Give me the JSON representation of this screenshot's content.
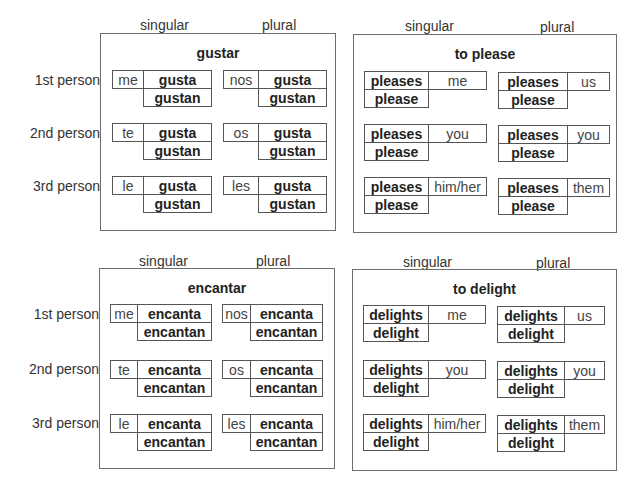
{
  "row_labels": [
    "1st person",
    "2nd person",
    "3rd person"
  ],
  "column_labels": {
    "singular": "singular",
    "plural": "plural"
  },
  "panels": [
    {
      "title": "gustar",
      "layout": "pronoun-first",
      "singular": [
        {
          "pronoun": "me",
          "verb_singular": "gusta",
          "verb_plural": "gustan"
        },
        {
          "pronoun": "te",
          "verb_singular": "gusta",
          "verb_plural": "gustan"
        },
        {
          "pronoun": "le",
          "verb_singular": "gusta",
          "verb_plural": "gustan"
        }
      ],
      "plural": [
        {
          "pronoun": "nos",
          "verb_singular": "gusta",
          "verb_plural": "gustan"
        },
        {
          "pronoun": "os",
          "verb_singular": "gusta",
          "verb_plural": "gustan"
        },
        {
          "pronoun": "les",
          "verb_singular": "gusta",
          "verb_plural": "gustan"
        }
      ]
    },
    {
      "title": "to please",
      "layout": "verb-first",
      "singular": [
        {
          "pronoun": "me",
          "verb_singular": "pleases",
          "verb_plural": "please"
        },
        {
          "pronoun": "you",
          "verb_singular": "pleases",
          "verb_plural": "please"
        },
        {
          "pronoun": "him/her",
          "verb_singular": "pleases",
          "verb_plural": "please"
        }
      ],
      "plural": [
        {
          "pronoun": "us",
          "verb_singular": "pleases",
          "verb_plural": "please"
        },
        {
          "pronoun": "you",
          "verb_singular": "pleases",
          "verb_plural": "please"
        },
        {
          "pronoun": "them",
          "verb_singular": "pleases",
          "verb_plural": "please"
        }
      ]
    },
    {
      "title": "encantar",
      "layout": "pronoun-first",
      "singular": [
        {
          "pronoun": "me",
          "verb_singular": "encanta",
          "verb_plural": "encantan"
        },
        {
          "pronoun": "te",
          "verb_singular": "encanta",
          "verb_plural": "encantan"
        },
        {
          "pronoun": "le",
          "verb_singular": "encanta",
          "verb_plural": "encantan"
        }
      ],
      "plural": [
        {
          "pronoun": "nos",
          "verb_singular": "encanta",
          "verb_plural": "encantan"
        },
        {
          "pronoun": "os",
          "verb_singular": "encanta",
          "verb_plural": "encantan"
        },
        {
          "pronoun": "les",
          "verb_singular": "encanta",
          "verb_plural": "encantan"
        }
      ]
    },
    {
      "title": "to delight",
      "layout": "verb-first",
      "singular": [
        {
          "pronoun": "me",
          "verb_singular": "delights",
          "verb_plural": "delight"
        },
        {
          "pronoun": "you",
          "verb_singular": "delights",
          "verb_plural": "delight"
        },
        {
          "pronoun": "him/her",
          "verb_singular": "delights",
          "verb_plural": "delight"
        }
      ],
      "plural": [
        {
          "pronoun": "us",
          "verb_singular": "delights",
          "verb_plural": "delight"
        },
        {
          "pronoun": "you",
          "verb_singular": "delights",
          "verb_plural": "delight"
        },
        {
          "pronoun": "them",
          "verb_singular": "delights",
          "verb_plural": "delight"
        }
      ]
    }
  ]
}
